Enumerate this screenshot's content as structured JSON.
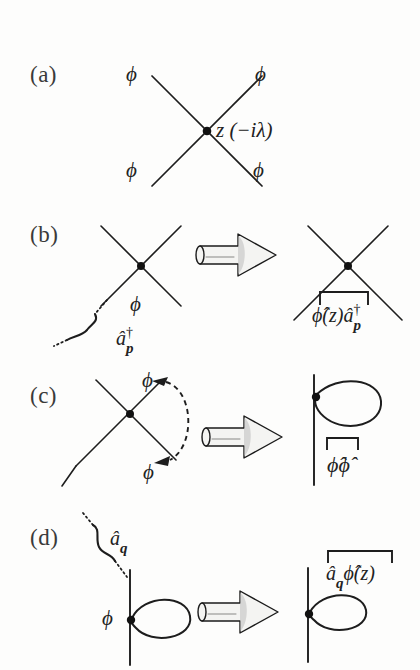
{
  "figure": {
    "ink_color": "#1d1d1d",
    "background_color": "#fdfdfc"
  },
  "panels": [
    {
      "id": "a",
      "label": "(a)",
      "vertex_label": "z (−iλ)",
      "leg_labels": [
        "ϕ",
        "ϕ",
        "ϕ",
        "ϕ"
      ],
      "legs": 4,
      "note": "four-point vertex at spacetime point z with coupling minus i lambda"
    },
    {
      "id": "b",
      "label": "(b)",
      "left_leg_label": "ϕ",
      "left_operator": "â",
      "left_operator_dagger": "†",
      "left_operator_sub": "p",
      "right_expression_1": "ϕ̂(z)",
      "right_expression_2": "â",
      "right_expression_2_dagger": "†",
      "right_expression_2_sub": "p",
      "arrow": "implies-arrow",
      "note": "external leg contracted with creation operator a-dagger-p"
    },
    {
      "id": "c",
      "label": "(c)",
      "leg_label_top": "ϕ",
      "leg_label_bottom": "ϕ",
      "right_expression": "ϕ̂ϕ̂",
      "arrow": "implies-arrow",
      "note": "two legs of same vertex self-contracted forming a tadpole loop"
    },
    {
      "id": "d",
      "label": "(d)",
      "operator": "â",
      "operator_sub": "q",
      "leg_label": "ϕ",
      "right_expression_1": "â",
      "right_expression_1_sub": "q",
      "right_expression_2": "ϕ̂(z)",
      "arrow": "implies-arrow",
      "note": "annihilation operator a-q contracted with field at loop vertex"
    }
  ],
  "glyphs": {
    "phi": "ϕ",
    "lambda": "λ",
    "dagger": "†",
    "hat": "̂",
    "z": "z",
    "minus_i": "−i"
  }
}
